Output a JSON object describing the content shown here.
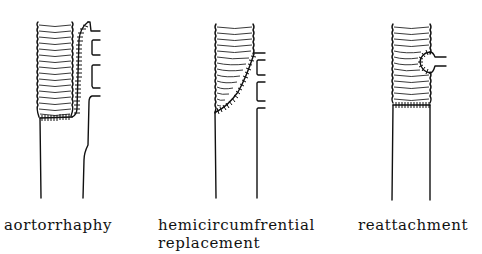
{
  "figure": {
    "panels": [
      {
        "id": "aortorrhaphy",
        "label": "aortorrhaphy",
        "graft_icon": "corrugated-graft",
        "technique": "graft replaces vessel with sutured side seam along branch wall"
      },
      {
        "id": "hemicircumferential",
        "label_line1": "hemicircumfrential",
        "label_line2": "replacement",
        "graft_icon": "corrugated-graft",
        "technique": "oblique suture line across graft"
      },
      {
        "id": "reattachment",
        "label": "reattachment",
        "graft_icon": "corrugated-graft",
        "technique": "single branch reattached with button suture"
      }
    ],
    "colors": {
      "ink": "#111111",
      "background": "#ffffff"
    }
  }
}
